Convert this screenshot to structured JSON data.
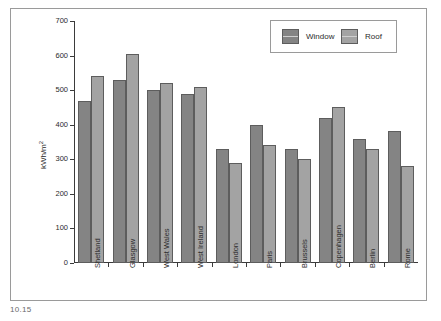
{
  "caption": "10.15",
  "legend": {
    "position": "top-right",
    "entries": [
      {
        "label": "Window",
        "swatch": "window-swatch",
        "color": "#848484"
      },
      {
        "label": "Roof",
        "swatch": "roof-swatch",
        "color": "#a3a3a3"
      }
    ]
  },
  "axes": {
    "ylabel": "kWh/m",
    "ylabel_exponent": "2",
    "yticks": [
      "0",
      "100",
      "200",
      "300",
      "400",
      "500",
      "600",
      "700"
    ],
    "ymin": 0,
    "ymax": 700
  },
  "chart_data": {
    "type": "bar",
    "title": "",
    "xlabel": "",
    "ylabel": "kWh/m2",
    "ylim": [
      0,
      700
    ],
    "ytick_step": 100,
    "grid": false,
    "legend_position": "top-right",
    "categories": [
      "Shetland",
      "Glasgow",
      "West Wales",
      "West Ireland",
      "London",
      "Paris",
      "Brussels",
      "Copenhagen",
      "Berlin",
      "Rome"
    ],
    "series": [
      {
        "name": "Window",
        "color": "#848484",
        "values": [
          470,
          530,
          500,
          490,
          330,
          400,
          330,
          420,
          360,
          382
        ]
      },
      {
        "name": "Roof",
        "color": "#a3a3a3",
        "values": [
          540,
          605,
          520,
          510,
          290,
          340,
          300,
          450,
          330,
          280
        ]
      }
    ]
  }
}
